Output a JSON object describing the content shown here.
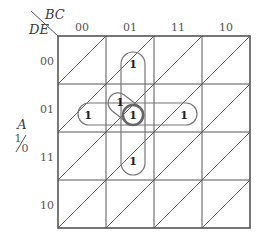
{
  "diagram": {
    "type": "karnaugh-map-5-variable-map-entered",
    "col_var": "BC",
    "row_var": "DE",
    "map_var": "A",
    "map_var_upper": "1",
    "map_var_lower": "0",
    "columns": [
      "00",
      "01",
      "11",
      "10"
    ],
    "rows": [
      "00",
      "01",
      "11",
      "10"
    ],
    "one_symbol": "1",
    "cells": [
      {
        "row": "00",
        "col": "01",
        "A": "1",
        "value": "1"
      },
      {
        "row": "01",
        "col": "01",
        "A": "1",
        "value": "1"
      },
      {
        "row": "01",
        "col": "01",
        "A": "0",
        "value": "1",
        "circled": true
      },
      {
        "row": "01",
        "col": "00",
        "A": "0",
        "value": "1"
      },
      {
        "row": "01",
        "col": "11",
        "A": "0",
        "value": "1"
      },
      {
        "row": "11",
        "col": "01",
        "A": "0",
        "value": "1"
      }
    ],
    "groups": [
      {
        "name": "vertical-group",
        "cells": [
          "00/01/A1",
          "01/01/A0",
          "11/01/A0"
        ]
      },
      {
        "name": "horizontal-group",
        "cells": [
          "01/00/A0",
          "01/01/A0",
          "01/11/A0"
        ]
      },
      {
        "name": "diagonal-group",
        "cells": [
          "01/01/A1",
          "01/01/A0"
        ]
      }
    ],
    "colors": {
      "grid": "#555555",
      "loop": "#777777",
      "circle": "#666666",
      "text": "#333333"
    }
  }
}
